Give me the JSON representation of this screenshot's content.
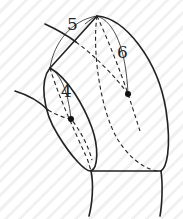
{
  "diagram": {
    "labels": [
      {
        "id": "4",
        "text": "4"
      },
      {
        "id": "5",
        "text": "5"
      },
      {
        "id": "6",
        "text": "6"
      }
    ],
    "colors": {
      "stroke": "#222222",
      "background": "#ffffff",
      "hatch": "#f1f1f1"
    }
  }
}
